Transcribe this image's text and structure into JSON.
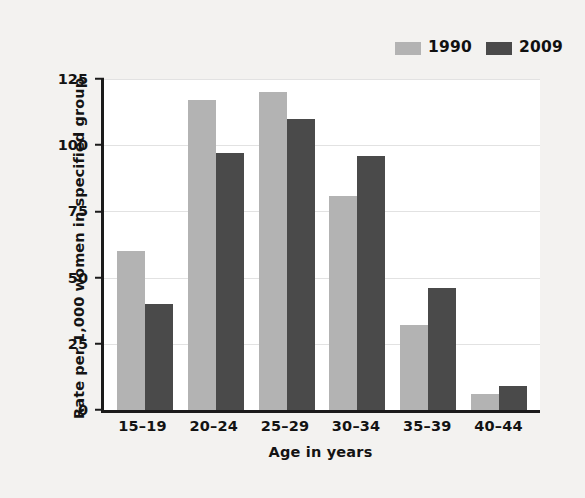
{
  "chart_data": {
    "type": "bar",
    "title": "",
    "xlabel": "Age in years",
    "ylabel": "Rate per 1,000 women in specified group",
    "categories": [
      "15–19",
      "20–24",
      "25–29",
      "30–34",
      "35–39",
      "40–44"
    ],
    "series": [
      {
        "name": "1990",
        "color": "#b3b3b3",
        "values": [
          60,
          117,
          120,
          81,
          32,
          6
        ]
      },
      {
        "name": "2009",
        "color": "#4a4a4a",
        "values": [
          40,
          97,
          110,
          96,
          46,
          9
        ]
      }
    ],
    "ylim": [
      0,
      125
    ],
    "yticks": [
      0,
      25,
      50,
      75,
      100,
      125
    ],
    "ytick_labels": [
      "0",
      "25",
      "50",
      "75",
      "100",
      "125"
    ],
    "grid": true,
    "legend_position": "top-right"
  },
  "legend": {
    "entries": [
      {
        "label": "1990"
      },
      {
        "label": "2009"
      }
    ]
  },
  "axes": {
    "y_title": "Rate per 1,000 women in specified group",
    "x_title": "Age in years"
  }
}
